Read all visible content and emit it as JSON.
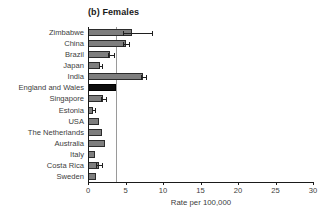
{
  "chart_data": {
    "type": "bar",
    "orientation": "horizontal",
    "title": "(b) Females",
    "xlabel": "Rate per 100,000",
    "ylabel": "",
    "xlim": [
      0,
      30
    ],
    "xticks": [
      0,
      5,
      10,
      15,
      20,
      25,
      30
    ],
    "xtick_labels": [
      "0",
      "5",
      "10",
      "15",
      "20",
      "25",
      "30"
    ],
    "grid": false,
    "legend": "none",
    "reference_line": 3.7,
    "highlight_category": "England and Wales",
    "colors": {
      "bar_fill": "#7e7e7e",
      "bar_edge": "#2b2b2b",
      "highlight_fill": "#0d0d0d",
      "reference_line": "#9a9a9a",
      "axis": "#1a1a1a",
      "text": "#3d3d3d"
    },
    "categories": [
      "Zimbabwe",
      "China",
      "Brazil",
      "Japan",
      "India",
      "England and Wales",
      "Singapore",
      "Estonia",
      "USA",
      "The Netherlands",
      "Australia",
      "Italy",
      "Costa Rica",
      "Sweden"
    ],
    "values": [
      5.9,
      5.1,
      2.9,
      1.6,
      7.3,
      3.7,
      2.0,
      0.7,
      1.5,
      1.9,
      2.2,
      0.9,
      1.4,
      1.1
    ],
    "error_low": [
      4.6,
      4.7,
      2.6,
      1.4,
      7.0,
      3.7,
      1.7,
      0.5,
      1.5,
      1.9,
      2.2,
      0.9,
      1.1,
      1.1
    ],
    "error_high": [
      8.5,
      5.5,
      3.4,
      1.9,
      7.7,
      3.7,
      2.4,
      0.9,
      1.5,
      1.9,
      2.2,
      0.9,
      1.8,
      1.1
    ],
    "series": [
      {
        "name": "Rate per 100,000 (females)",
        "values": [
          5.9,
          5.1,
          2.9,
          1.6,
          7.3,
          3.7,
          2.0,
          0.7,
          1.5,
          1.9,
          2.2,
          0.9,
          1.4,
          1.1
        ]
      }
    ]
  }
}
